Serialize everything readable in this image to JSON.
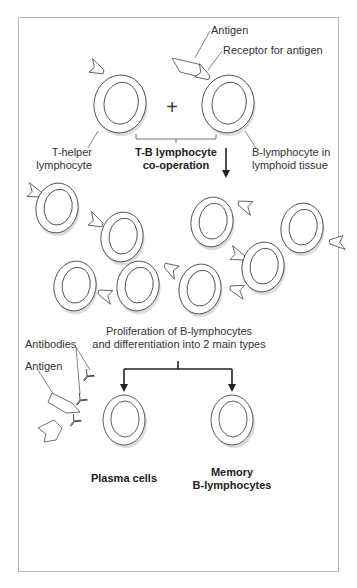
{
  "diagram": {
    "labels": {
      "antigen_top": "Antigen",
      "receptor": "Receptor for antigen",
      "t_helper_line1": "T-helper",
      "t_helper_line2": "lymphocyte",
      "plus": "+",
      "cooperation_line1": "T-B lymphocyte",
      "cooperation_line2": "co-operation",
      "b_lymph_line1": "B-lymphocyte in",
      "b_lymph_line2": "lymphoid tissue",
      "proliferation_line1": "Proliferation of B-lymphocytes",
      "proliferation_line2": "and differentiation into 2 main types",
      "antibodies": "Antibodies",
      "antigen_bottom": "Antigen",
      "plasma_cells": "Plasma cells",
      "memory_line1": "Memory",
      "memory_line2": "B-lymphocytes"
    },
    "colors": {
      "stroke": "#333333",
      "frame": "#b8b8b8",
      "shadow": "#d9d9d9",
      "background": "#ffffff"
    },
    "stages": [
      {
        "name": "co-operation",
        "cells": [
          "T-helper lymphocyte",
          "B-lymphocyte in lymphoid tissue"
        ]
      },
      {
        "name": "proliferation",
        "cell_count": 8
      },
      {
        "name": "differentiation",
        "cells": [
          "Plasma cells",
          "Memory B-lymphocytes"
        ]
      }
    ]
  }
}
